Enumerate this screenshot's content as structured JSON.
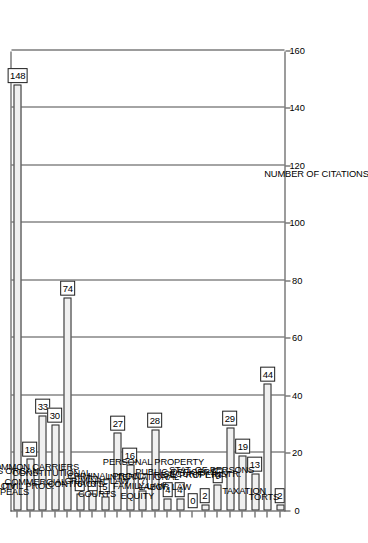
{
  "chart_data": {
    "type": "bar",
    "orientation": "vertical",
    "title": "",
    "subtitle": "",
    "xlabel": "",
    "ylabel": "NUMBER OF CITATIONS",
    "ylim": [
      0,
      160
    ],
    "ytick_step": 20,
    "yticks": [
      0,
      20,
      40,
      60,
      80,
      100,
      120,
      140,
      160
    ],
    "grid": true,
    "grid_axis": "y",
    "legend": null,
    "legend_position": "none",
    "rotated_page": true,
    "categories": [
      "ADMIRALITY",
      "APPEALS",
      "BUSINESS ORGAN.",
      "CIVIL PROC.",
      "COMMERCIAL",
      "COMMON CARRIERS",
      "CONSTITUTIONAL",
      "CONTRACTS",
      "COURTS",
      "CRIMINAL LAW",
      "CRIMINAL PROC.",
      "EQUITY",
      "FAMILY LAW",
      "INTERNATIONAL",
      "LABOR LAW",
      "PERSONAL PROPERTY",
      "PUBLIC OFFICERS",
      "REAL PROPERTY",
      "SECURITY INSTR.",
      "STAT. OF PERSONS",
      "TAXATION",
      "TORTS"
    ],
    "values": [
      148,
      18,
      33,
      30,
      74,
      6,
      6,
      5,
      27,
      16,
      7,
      28,
      4,
      4,
      0,
      2,
      9,
      29,
      19,
      13,
      44,
      2
    ],
    "value_labels": [
      "148",
      "18",
      "33",
      "30",
      "74",
      "6",
      "6",
      "5",
      "27",
      "16",
      "7",
      "28",
      "4",
      "4",
      "0",
      "2",
      "9",
      "29",
      "19",
      "13",
      "44",
      "2"
    ],
    "colors": {
      "bar_fill": "#d2d2d2",
      "bar_edge": "#2e2e2e",
      "axis": "#3a3a3a",
      "grid": "#4a4a4a",
      "text": "#000000",
      "background": "#ffffff"
    }
  }
}
